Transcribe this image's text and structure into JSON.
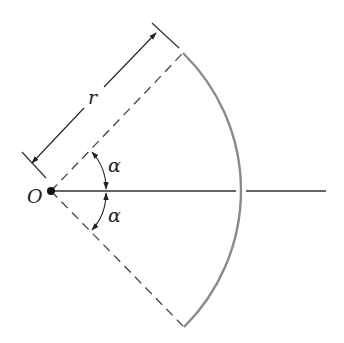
{
  "diagram": {
    "labels": {
      "origin": "O",
      "radius": "r",
      "angle_upper": "α",
      "angle_lower": "α"
    },
    "colors": {
      "line": "#222222",
      "arc": "#8a8a8a",
      "dashed": "#444444"
    }
  }
}
